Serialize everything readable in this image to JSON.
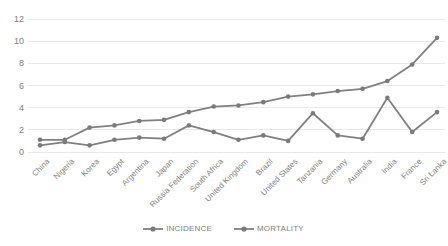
{
  "chart_data": {
    "type": "line",
    "title": "",
    "xlabel": "",
    "ylabel": "",
    "ylim": [
      0,
      12
    ],
    "yticks": [
      0,
      2,
      4,
      6,
      8,
      10,
      12
    ],
    "grid": true,
    "legend_position": "bottom",
    "categories": [
      "China",
      "Nigeria",
      "Korea",
      "Egypt",
      "Argentina",
      "Japan",
      "Russia Federation",
      "South Africa",
      "United Kingdom",
      "Brazil",
      "United States",
      "Tanzania",
      "Germany",
      "Australia",
      "India",
      "France",
      "Sri Lanka"
    ],
    "series": [
      {
        "name": "INCIDENCE",
        "color": "#808080",
        "values": [
          1.1,
          1.1,
          2.2,
          2.4,
          2.8,
          2.9,
          3.6,
          4.1,
          4.2,
          4.5,
          5.0,
          5.2,
          5.5,
          5.7,
          6.4,
          7.9,
          10.3
        ]
      },
      {
        "name": "MORTALITY",
        "color": "#808080",
        "values": [
          0.6,
          0.9,
          0.6,
          1.1,
          1.3,
          1.2,
          2.4,
          1.8,
          1.1,
          1.5,
          1.0,
          3.5,
          1.5,
          1.2,
          4.9,
          1.8,
          3.6
        ]
      }
    ]
  },
  "legend": {
    "items": [
      {
        "label": "INCIDENCE"
      },
      {
        "label": "MORTALITY"
      }
    ]
  },
  "colors": {
    "line": "#808080",
    "marker": "#7a7a7a",
    "grid": "#e8e8e8",
    "tick_text": "#808080",
    "background": "#ffffff"
  }
}
